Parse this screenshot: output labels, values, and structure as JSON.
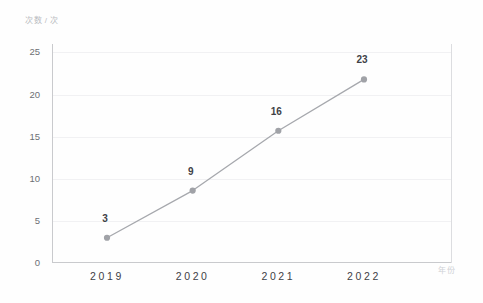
{
  "chart_data": {
    "type": "line",
    "title": "",
    "subtitle": "",
    "xlabel": "年份",
    "ylabel": "次数 / 次",
    "categories": [
      "2019",
      "2020",
      "2021",
      "2022"
    ],
    "values": [
      3,
      9,
      16,
      23
    ],
    "plotted_values": [
      3.0,
      8.6,
      15.7,
      21.8
    ],
    "point_labels": [
      "3",
      "9",
      "16",
      "23"
    ],
    "series": [
      {
        "name": "次数",
        "values": [
          3,
          9,
          16,
          23
        ]
      }
    ],
    "ylim": [
      0,
      26
    ],
    "yticks": [
      0,
      5,
      10,
      15,
      20,
      25
    ],
    "ytick_labels": [
      "0",
      "5",
      "10",
      "15",
      "20",
      "25"
    ],
    "grid": true,
    "grid_axis": "y",
    "legend": false,
    "legend_position": "none",
    "line_color": "#a6a8ad",
    "marker_color": "#a0a2a7",
    "marker_shape": "circle",
    "background_color": "#fefefe",
    "gridline_color": "#f1f1f3",
    "axis_color": "#c9cacd",
    "label_text_color": "#3f4146",
    "tick_text_color": "#6d6f74"
  },
  "axes": {
    "y_unit_caption": "次数 / 次",
    "x_unit_caption": "年份"
  }
}
